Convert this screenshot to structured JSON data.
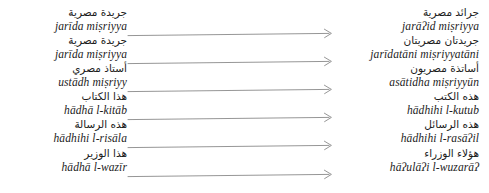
{
  "figure": {
    "type": "linguistic-transformation-list",
    "direction": "left-to-right",
    "arrow_count": 6,
    "arrow_color": "#8a8a8a",
    "text_color": "#1c1c1c",
    "background_color": "#ffffff"
  },
  "rows": [
    {
      "source_arabic": "جريدة مصرية",
      "source_translit": "jarīda miṣriyya",
      "target_arabic": "جرائد مصرية",
      "target_translit": "jarāʔid miṣriyya",
      "arrow": "→"
    },
    {
      "source_arabic": "جريدة مصرية",
      "source_translit": "jarīda miṣriyya",
      "target_arabic": "جريدتان مصريتان",
      "target_translit": "jarīdatāni miṣriyyatāni",
      "arrow": "→"
    },
    {
      "source_arabic": "أستاذ مصري",
      "source_translit": "ustādh miṣriyy",
      "target_arabic": "أساتذة مصريون",
      "target_translit": "asātidha miṣriyyūn",
      "arrow": "→"
    },
    {
      "source_arabic": "هذا الكتاب",
      "source_translit": "hādhā l-kitāb",
      "target_arabic": "هذه الكتب",
      "target_translit": "hādhihi l-kutub",
      "arrow": "→"
    },
    {
      "source_arabic": "هذه الرسالة",
      "source_translit": "hādhihi l-risāla",
      "target_arabic": "هذه الرسائل",
      "target_translit": "hādhihi l-rasāʔil",
      "arrow": "→"
    },
    {
      "source_arabic": "هذا الوزير",
      "source_translit": "hādhā l-wazīr",
      "target_arabic": "هؤلاء الوزراء",
      "target_translit": "hāʔulāʔi l-wuzarāʔ",
      "arrow": "→"
    }
  ]
}
